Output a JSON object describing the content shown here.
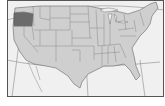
{
  "map": {
    "type": "locator-map",
    "region": "United States (contiguous)",
    "highlighted_state": "Oregon",
    "colors": {
      "background": "#f2f2f2",
      "land": "#cfcfcf",
      "highlight": "#6b6b6b",
      "border": "#7a7a7a",
      "frame": "#555555",
      "graticule": "#8a8a8a",
      "page": "#ffffff"
    }
  }
}
